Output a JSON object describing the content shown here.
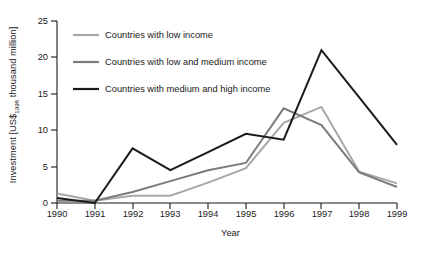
{
  "chart_data": {
    "type": "line",
    "title": "",
    "xlabel": "Year",
    "ylabel_prefix": "Investment [US$",
    "ylabel_sub": "1998",
    "ylabel_suffix": " thousand million]",
    "ylabel_full": "Investment [US$1998 thousand million]",
    "categories": [
      "1990",
      "1991",
      "1992",
      "1993",
      "1994",
      "1995",
      "1996",
      "1997",
      "1998",
      "1999"
    ],
    "x": [
      1990,
      1991,
      1992,
      1993,
      1994,
      1995,
      1996,
      1997,
      1998,
      1999
    ],
    "xlim": [
      1990,
      1999
    ],
    "ylim": [
      0,
      25
    ],
    "yticks": [
      0,
      5,
      10,
      15,
      20,
      25
    ],
    "xticks": [
      "1990",
      "1991",
      "1992",
      "1993",
      "1994",
      "1995",
      "1996",
      "1997",
      "1998",
      "1999"
    ],
    "grid": false,
    "legend_position": "upper-left-inside",
    "series": [
      {
        "name": "Countries with low income",
        "color": "#a8a8a8",
        "width": 2.0,
        "values": [
          1.3,
          0.3,
          1.0,
          1.0,
          2.8,
          4.8,
          11.0,
          13.2,
          4.3,
          2.7
        ]
      },
      {
        "name": "Countries with low and medium income",
        "color": "#7c7c7c",
        "width": 2.0,
        "values": [
          0.3,
          0.3,
          1.5,
          3.0,
          4.5,
          5.5,
          13.0,
          10.7,
          4.2,
          2.2
        ]
      },
      {
        "name": "Countries with medium and high income",
        "color": "#1a1a1a",
        "width": 2.0,
        "values": [
          0.7,
          0.0,
          7.5,
          4.5,
          7.0,
          9.5,
          8.7,
          21.0,
          14.5,
          8.0
        ]
      }
    ]
  },
  "axes": {
    "ytick_labels": [
      "25",
      "20",
      "15",
      "10",
      "5",
      "0"
    ],
    "xtick_labels": [
      "1990",
      "1991",
      "1992",
      "1993",
      "1994",
      "1995",
      "1996",
      "1997",
      "1998",
      "1999"
    ]
  },
  "legend": {
    "entries": [
      {
        "label": "Countries with low income",
        "color": "#a8a8a8"
      },
      {
        "label": "Countries with low and medium income",
        "color": "#7c7c7c"
      },
      {
        "label": "Countries with medium and high income",
        "color": "#1a1a1a"
      }
    ]
  },
  "colors": {
    "axis": "#1a1a1a",
    "text": "#1a1a1a",
    "background": "#ffffff",
    "series_low": "#a8a8a8",
    "series_low_medium": "#7c7c7c",
    "series_medium_high": "#1a1a1a"
  }
}
